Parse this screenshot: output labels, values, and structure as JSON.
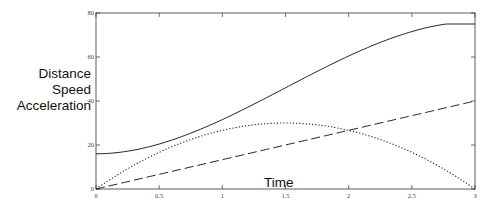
{
  "chart_data": {
    "type": "line",
    "title": "",
    "xlabel": "Time",
    "ylabel_lines": [
      "Distance",
      "Speed",
      "Acceleration"
    ],
    "xlim": [
      0,
      3
    ],
    "ylim": [
      0,
      80
    ],
    "xticks": [
      0,
      0.5,
      1,
      1.5,
      2,
      2.5,
      3
    ],
    "xtick_labels": [
      "0",
      "0.5",
      "1",
      "1.5",
      "2",
      "2.5",
      "3"
    ],
    "yticks": [
      0,
      20,
      40,
      60,
      80
    ],
    "ytick_labels": [
      "0",
      "20",
      "40",
      "60",
      "80"
    ],
    "grid": false,
    "legend": null,
    "x": [
      0,
      0.25,
      0.5,
      0.75,
      1,
      1.25,
      1.5,
      1.75,
      2,
      2.25,
      2.5,
      2.75,
      3
    ],
    "series": [
      {
        "name": "Distance",
        "style": "solid",
        "values": [
          16,
          16.8,
          19.3,
          23.2,
          28.4,
          34.6,
          41.0,
          47.4,
          53.6,
          58.8,
          62.7,
          65.2,
          76
        ]
      },
      {
        "name": "Speed",
        "style": "dotted",
        "values": [
          0,
          9.2,
          16.7,
          22.5,
          26.7,
          29.2,
          30,
          29.2,
          26.7,
          22.5,
          16.7,
          9.2,
          0
        ]
      },
      {
        "name": "Acceleration",
        "style": "dashed",
        "values": [
          0,
          3.3,
          6.7,
          10,
          13.3,
          16.7,
          20,
          23.3,
          26.7,
          30,
          33.3,
          36.7,
          40
        ]
      }
    ]
  },
  "axis_labels": {
    "y_line1": "Distance",
    "y_line2": "Speed",
    "y_line3": "Acceleration",
    "x": "Time"
  }
}
